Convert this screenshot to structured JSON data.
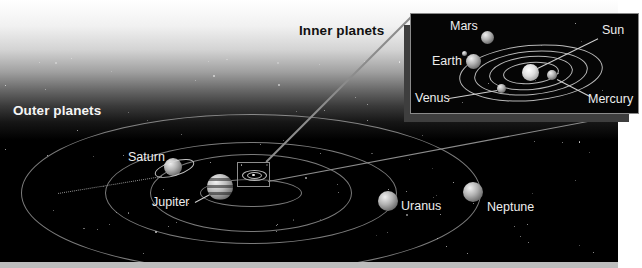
{
  "titles": {
    "inner": "Inner planets",
    "outer": "Outer planets"
  },
  "colors": {
    "page_bg": "#ffffff",
    "space_black": "#000000",
    "orbit_line": "#c6c6c6",
    "callout_line": "#8c8c8c",
    "leader_line": "#cfcfcf",
    "label_text": "#ededed",
    "inner_title_color": "#111111",
    "outer_title_color": "#f5f5f5",
    "inset_border": "#8a8a8a",
    "bottom_strip": "#bdbdbd"
  },
  "outer_system": {
    "center": {
      "x": 250,
      "y": 192
    },
    "orbit_tilt_deg": 0,
    "orbits": [
      {
        "planet": "Jupiter",
        "rx": 50,
        "ry": 13
      },
      {
        "planet": "Saturn",
        "rx": 100,
        "ry": 38
      },
      {
        "planet": "Uranus",
        "rx": 145,
        "ry": 50
      },
      {
        "planet": "Neptune",
        "rx": 229,
        "ry": 78
      }
    ],
    "planets": [
      {
        "name": "saturn",
        "label": "Saturn",
        "x": 173,
        "y": 167,
        "r": 9,
        "style": "ringed",
        "label_x": 128,
        "label_y": 151
      },
      {
        "name": "jupiter",
        "label": "Jupiter",
        "x": 220,
        "y": 187,
        "r": 13,
        "style": "banded",
        "label_x": 152,
        "label_y": 196,
        "leader": {
          "x1": 195,
          "y1": 202,
          "x2": 210,
          "y2": 194
        }
      },
      {
        "name": "uranus",
        "label": "Uranus",
        "x": 388,
        "y": 201,
        "r": 10,
        "style": "plain",
        "label_x": 401,
        "label_y": 200
      },
      {
        "name": "neptune",
        "label": "Neptune",
        "x": 473,
        "y": 192,
        "r": 10,
        "style": "plain",
        "label_x": 487,
        "label_y": 201
      }
    ]
  },
  "inner_system": {
    "center": {
      "x": 530,
      "y": 72
    },
    "orbit_tilt_deg": -5,
    "orbits": [
      {
        "planet": "Mercury",
        "rx": 27,
        "ry": 10
      },
      {
        "planet": "Venus",
        "rx": 41,
        "ry": 16
      },
      {
        "planet": "Earth",
        "rx": 56,
        "ry": 21
      },
      {
        "planet": "Mars",
        "rx": 71,
        "ry": 27
      }
    ],
    "planets": [
      {
        "name": "sun",
        "label": "Sun",
        "x": 530,
        "y": 72,
        "r": 8.5,
        "style": "sun",
        "label_x": 602,
        "label_y": 24,
        "leader": {
          "x1": 598,
          "y1": 38,
          "x2": 537,
          "y2": 68
        }
      },
      {
        "name": "mercury",
        "label": "Mercury",
        "x": 552,
        "y": 75,
        "r": 5,
        "style": "plain",
        "label_x": 588,
        "label_y": 93,
        "leader": {
          "x1": 557,
          "y1": 79,
          "x2": 590,
          "y2": 96
        }
      },
      {
        "name": "venus",
        "label": "Venus",
        "x": 501,
        "y": 88,
        "r": 4.5,
        "style": "plain",
        "label_x": 415,
        "label_y": 92,
        "leader": {
          "x1": 449,
          "y1": 98,
          "x2": 497,
          "y2": 90
        }
      },
      {
        "name": "earth",
        "label": "Earth",
        "x": 473,
        "y": 61,
        "r": 7.5,
        "style": "plain",
        "label_x": 432,
        "label_y": 55
      },
      {
        "name": "moon",
        "label": "",
        "x": 464,
        "y": 53,
        "r": 2.5,
        "style": "plain"
      },
      {
        "name": "mars",
        "label": "Mars",
        "x": 487,
        "y": 37,
        "r": 6.5,
        "style": "plain",
        "label_x": 450,
        "label_y": 20
      }
    ]
  },
  "callouts": {
    "target_box": {
      "x": 237,
      "y": 162,
      "w": 31,
      "h": 23
    },
    "inset_box": {
      "x": 410,
      "y": 13,
      "w": 227,
      "h": 99
    },
    "line_top": {
      "x1": 266,
      "y1": 161,
      "x2": 412,
      "y2": 15
    },
    "line_bottom": {
      "x1": 268,
      "y1": 181,
      "x2": 636,
      "y2": 112
    }
  },
  "decorations": {
    "dashed_segment": {
      "x1": 58,
      "y1": 193,
      "x2": 162,
      "y2": 176
    },
    "star_count": 95,
    "inset_star_count": 9
  }
}
